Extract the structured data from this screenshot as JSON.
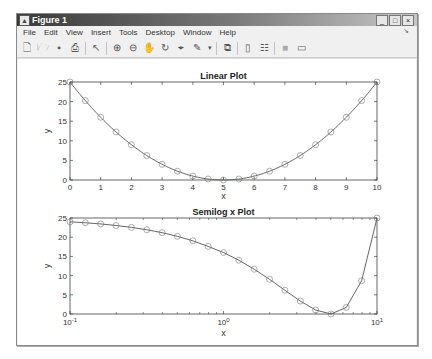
{
  "window": {
    "title": "Figure 1",
    "controls": [
      "_",
      "□",
      "×"
    ]
  },
  "menu": [
    "File",
    "Edit",
    "View",
    "Insert",
    "Tools",
    "Desktop",
    "Window",
    "Help"
  ],
  "toolbar": [
    "new-figure",
    "open-file",
    "save",
    "print",
    "edit-plot",
    "zoom-in",
    "zoom-out",
    "pan",
    "rotate-3d",
    "data-cursor",
    "brush",
    "link-plot",
    "colorbar",
    "legend",
    "hide-plot-tools",
    "show-plot-tools"
  ],
  "chart_data": [
    {
      "type": "line",
      "title": "Linear Plot",
      "xlabel": "x",
      "ylabel": "y",
      "xscale": "linear",
      "xlim": [
        0,
        10
      ],
      "ylim": [
        0,
        25
      ],
      "xticks": [
        "0",
        "1",
        "2",
        "3",
        "4",
        "5",
        "6",
        "7",
        "8",
        "9",
        "10"
      ],
      "yticks": [
        "0",
        "5",
        "10",
        "15",
        "20",
        "25"
      ],
      "marker": "o",
      "x": [
        0,
        0.5,
        1,
        1.5,
        2,
        2.5,
        3,
        3.5,
        4,
        4.5,
        5,
        5.5,
        6,
        6.5,
        7,
        7.5,
        8,
        8.5,
        9,
        9.5,
        10
      ],
      "y": [
        25,
        20.25,
        16,
        12.25,
        9,
        6.25,
        4,
        2.25,
        1,
        0.25,
        0,
        0.25,
        1,
        2.25,
        4,
        6.25,
        9,
        12.25,
        16,
        20.25,
        25
      ],
      "grid": false
    },
    {
      "type": "line",
      "title": "Semilog x Plot",
      "xlabel": "x",
      "ylabel": "y",
      "xscale": "log",
      "xlim": [
        0.1,
        10
      ],
      "ylim": [
        0,
        25
      ],
      "xticks": [
        "10^-1",
        "10^0",
        "10^1"
      ],
      "yticks": [
        "0",
        "5",
        "10",
        "15",
        "20",
        "25"
      ],
      "marker": "o",
      "x": [
        0.1,
        0.1259,
        0.1585,
        0.1995,
        0.2512,
        0.3162,
        0.3981,
        0.5012,
        0.631,
        0.7943,
        1,
        1.2589,
        1.5849,
        1.9953,
        2.5119,
        3.1623,
        3.9811,
        5.0119,
        6.3096,
        7.9433,
        10
      ],
      "y": [
        24.01,
        23.76,
        23.45,
        23.05,
        22.56,
        21.94,
        21.18,
        20.23,
        19.06,
        17.6,
        16,
        14.0,
        11.66,
        9.03,
        6.19,
        3.37,
        1.04,
        0.0,
        1.72,
        8.67,
        25
      ],
      "grid": false
    }
  ]
}
